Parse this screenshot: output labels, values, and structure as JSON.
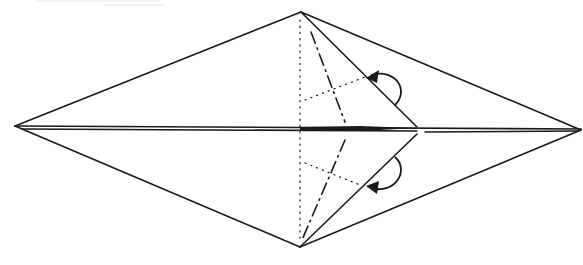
{
  "diagram": {
    "type": "origami-folding-step",
    "colors": {
      "line": "#1a1a1a",
      "background": "#ffffff"
    },
    "points": {
      "left_tip": [
        15,
        126
      ],
      "right_tip": [
        581,
        130
      ],
      "top": [
        301,
        12
      ],
      "bottom": [
        300,
        247
      ],
      "flap_tip": [
        417,
        128
      ]
    },
    "fold_lines": [
      {
        "kind": "valley",
        "description": "vertical dotted center line"
      },
      {
        "kind": "mountain",
        "description": "dash-dot line, upper flap"
      },
      {
        "kind": "mountain",
        "description": "dash-dot line, lower flap"
      },
      {
        "kind": "valley",
        "description": "dotted diagonal, upper flap"
      },
      {
        "kind": "valley",
        "description": "dotted diagonal, lower flap"
      }
    ],
    "arrows": [
      {
        "label": "fold-behind-arrow-upper",
        "direction": "curved, fold flap behind"
      },
      {
        "label": "fold-behind-arrow-lower",
        "direction": "curved, fold flap behind"
      }
    ],
    "caption": "Origami folding diagram step"
  }
}
